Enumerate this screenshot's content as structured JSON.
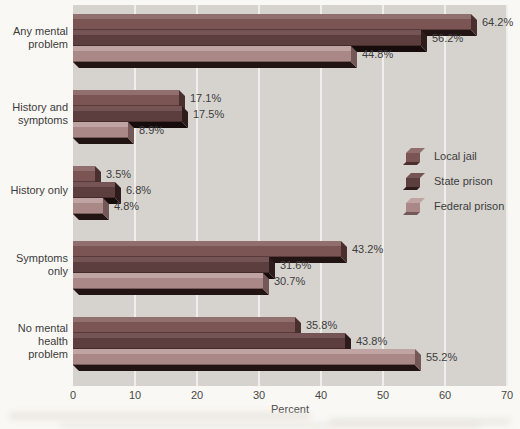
{
  "chart_data": {
    "type": "bar",
    "orientation": "horizontal",
    "title": "",
    "xlabel": "Percent",
    "xlim": [
      0,
      70
    ],
    "x_ticks": [
      0,
      10,
      20,
      30,
      40,
      50,
      60,
      70
    ],
    "grid": "vertical-light",
    "legend_position": "right-middle",
    "categories": [
      "Any mental problem",
      "History and symptoms",
      "History only",
      "Symptoms only",
      "No mental health problem"
    ],
    "category_lines": [
      [
        "Any mental",
        "problem"
      ],
      [
        "History and",
        "symptoms"
      ],
      [
        "History only"
      ],
      [
        "Symptoms",
        "only"
      ],
      [
        "No mental",
        "health",
        "problem"
      ]
    ],
    "series": [
      {
        "name": "Local jail",
        "values": [
          64.2,
          17.1,
          3.5,
          43.2,
          35.8
        ],
        "color": "#7b5454",
        "color_light": "#926f6f",
        "color_dark": "#4a2f2f",
        "color_shadow": "#231414"
      },
      {
        "name": "State prison",
        "values": [
          56.2,
          17.5,
          6.8,
          31.6,
          43.8
        ],
        "color": "#5d3e3e",
        "color_light": "#745454",
        "color_dark": "#2e1c1c",
        "color_shadow": "#160c0c"
      },
      {
        "name": "Federal prison",
        "values": [
          44.8,
          8.9,
          4.8,
          30.7,
          55.2
        ],
        "color": "#aa8888",
        "color_light": "#c0a4a4",
        "color_dark": "#745757",
        "color_shadow": "#231414"
      }
    ],
    "value_label_suffix": "%"
  },
  "colors": {
    "plot_background": "#d6d3cf",
    "gridline": "#f0eeea",
    "paper": "#faf8f4",
    "text": "#3f3f3f"
  }
}
